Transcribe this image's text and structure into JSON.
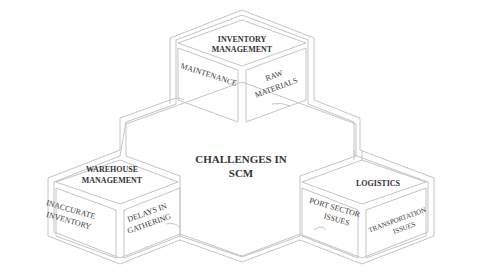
{
  "title": "CHALLENGES IN SCM",
  "center": {
    "line1": "CHALLENGES IN",
    "line2": "SCM"
  },
  "cubes": [
    {
      "name": "inventory-management",
      "top_line1": "INVENTORY",
      "top_line2": "MANAGEMENT",
      "left_line1": "MAINTENANCE",
      "right_line1": "RAW",
      "right_line2": "MATERIALS"
    },
    {
      "name": "warehouse-management",
      "top_line1": "WAREHOUSE",
      "top_line2": "MANAGEMENT",
      "left_line1": "INACCURATE",
      "left_line2": "INVENTORY",
      "right_line1": "DELAYS IN",
      "right_line2": "GATHERING"
    },
    {
      "name": "logistics",
      "top_line1": "LOGISTICS",
      "left_line1": "PORT SECTOR",
      "left_line2": "ISSUES",
      "right_line1": "TRANSPORTATION",
      "right_line2": "ISSUES"
    }
  ],
  "colors": {
    "line": "#c4c4c4",
    "text": "#3a3a3a"
  }
}
